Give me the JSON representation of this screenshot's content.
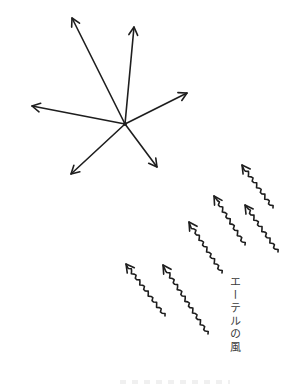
{
  "diagram": {
    "title": "",
    "colors": {
      "ink": "#1e1e1e",
      "label": "#3a3a3a",
      "background": "#ffffff"
    },
    "star": {
      "name": "radiating-arrows",
      "center": [
        125,
        124
      ],
      "arrow_tips": [
        {
          "direction": "upper-left",
          "tip": [
            72,
            18
          ]
        },
        {
          "direction": "up",
          "tip": [
            134,
            27
          ]
        },
        {
          "direction": "right",
          "tip": [
            187,
            93
          ]
        },
        {
          "direction": "left",
          "tip": [
            32,
            106
          ]
        },
        {
          "direction": "lower-left",
          "tip": [
            71,
            174
          ]
        },
        {
          "direction": "lower-right",
          "tip": [
            157,
            167
          ]
        }
      ]
    },
    "wind_arrows": {
      "name": "wavy-arrows",
      "direction": "upper-left",
      "items": [
        {
          "tip": [
            126,
            264
          ],
          "tail": [
            165,
            316
          ]
        },
        {
          "tip": [
            163,
            265
          ],
          "tail": [
            208,
            334
          ]
        },
        {
          "tip": [
            189,
            222
          ],
          "tail": [
            222,
            273
          ]
        },
        {
          "tip": [
            214,
            196
          ],
          "tail": [
            245,
            245
          ]
        },
        {
          "tip": [
            245,
            205
          ],
          "tail": [
            278,
            252
          ]
        },
        {
          "tip": [
            242,
            165
          ],
          "tail": [
            273,
            208
          ]
        }
      ]
    },
    "label": "エーテルの風"
  }
}
